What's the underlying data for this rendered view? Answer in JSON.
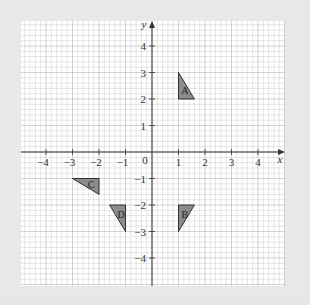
{
  "diagram": {
    "type": "coordinate-grid",
    "axes": {
      "x_label": "x",
      "y_label": "y",
      "origin_label": "0",
      "x_ticks": [
        "-4",
        "-3",
        "-2",
        "-1",
        "1",
        "2",
        "3",
        "4"
      ],
      "y_ticks": [
        "4",
        "3",
        "2",
        "1",
        "-1",
        "-2",
        "-3",
        "-4"
      ],
      "range": {
        "x": [
          -5,
          5
        ],
        "y": [
          -5,
          5
        ]
      },
      "minor_step": 0.2
    },
    "shapes": [
      {
        "label": "A",
        "vertices": [
          [
            1,
            3
          ],
          [
            1,
            2
          ],
          [
            1.6,
            2
          ]
        ]
      },
      {
        "label": "B",
        "vertices": [
          [
            1,
            -2
          ],
          [
            1.6,
            -2
          ],
          [
            1,
            -3
          ]
        ]
      },
      {
        "label": "C",
        "vertices": [
          [
            -3,
            -1
          ],
          [
            -2,
            -1
          ],
          [
            -2,
            -1.6
          ]
        ]
      },
      {
        "label": "D",
        "vertices": [
          [
            -1.6,
            -2
          ],
          [
            -1,
            -2
          ],
          [
            -1,
            -3
          ]
        ]
      }
    ],
    "colors": {
      "background": "#e8e8e8",
      "plot": "#ffffff",
      "minor_grid": "#d4d4d4",
      "major_grid": "#b4b4b4",
      "axis": "#333333",
      "triangle_fill": "#8c8c8c",
      "triangle_stroke": "#222222"
    }
  }
}
